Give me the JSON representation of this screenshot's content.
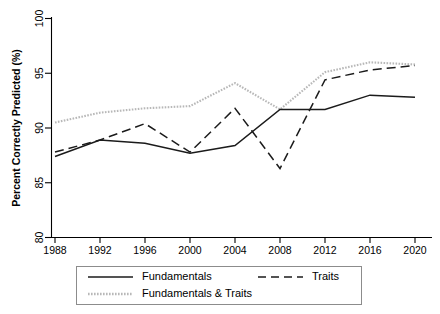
{
  "chart_data": {
    "type": "line",
    "title": "",
    "xlabel": "",
    "ylabel": "Percent Correctly Predicted (%)",
    "x": [
      1988,
      1992,
      1996,
      2000,
      2004,
      2008,
      2012,
      2016,
      2020
    ],
    "xticklabels": [
      "1988",
      "1992",
      "1996",
      "2000",
      "2004",
      "2008",
      "2012",
      "2016",
      "2020"
    ],
    "yticklabels": [
      "80",
      "85",
      "90",
      "95",
      "100"
    ],
    "yticks": [
      80,
      85,
      90,
      95,
      100
    ],
    "xlim": [
      1988,
      2020
    ],
    "ylim": [
      80,
      100
    ],
    "grid": false,
    "legend_position": "below-axes",
    "series": [
      {
        "name": "Fundamentals",
        "style": "solid",
        "color": "#1b1b1b",
        "values": [
          87.4,
          88.9,
          88.6,
          87.7,
          88.4,
          91.7,
          91.7,
          93.0,
          92.8
        ]
      },
      {
        "name": "Traits",
        "style": "dashed",
        "color": "#1b1b1b",
        "values": [
          87.8,
          88.9,
          90.4,
          87.8,
          91.8,
          86.3,
          94.4,
          95.3,
          95.7
        ]
      },
      {
        "name": "Fundamentals & Traits",
        "style": "dotted",
        "color": "#b8b8b8",
        "values": [
          90.5,
          91.4,
          91.8,
          92.0,
          94.1,
          91.7,
          95.1,
          96.0,
          95.8
        ]
      }
    ]
  },
  "legend": {
    "entries": [
      {
        "label": "Fundamentals"
      },
      {
        "label": "Traits"
      },
      {
        "label": "Fundamentals & Traits"
      }
    ]
  }
}
